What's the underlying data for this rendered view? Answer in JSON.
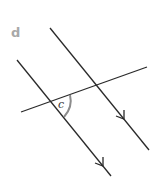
{
  "figure": {
    "part_label": "d",
    "angle_label": "c",
    "colors": {
      "line": "#2a2a2a",
      "arc": "#8c8c8c",
      "part_label": "#a8a8a8"
    },
    "lines": {
      "parallel_left": {
        "x1": 17,
        "y1": 60,
        "x2": 111,
        "y2": 176
      },
      "parallel_right": {
        "x1": 50,
        "y1": 28,
        "x2": 149,
        "y2": 150
      },
      "transversal": {
        "x1": 21,
        "y1": 112,
        "x2": 147,
        "y2": 67
      }
    },
    "arrows": [
      {
        "on": "parallel_left",
        "tip_x": 103,
        "tip_y": 166
      },
      {
        "on": "parallel_right",
        "tip_x": 124,
        "tip_y": 119
      }
    ]
  }
}
